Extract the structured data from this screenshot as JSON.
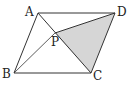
{
  "diagram": {
    "type": "parallelogram",
    "fill_color": "#d6d6d6",
    "stroke_color": "#333333",
    "vertices": {
      "A": {
        "label": "A",
        "x": 38,
        "y": 13
      },
      "D": {
        "label": "D",
        "x": 115,
        "y": 13
      },
      "B": {
        "label": "B",
        "x": 14,
        "y": 73
      },
      "C": {
        "label": "C",
        "x": 91,
        "y": 73
      },
      "P": {
        "label": "P",
        "x": 55,
        "y": 33
      }
    },
    "segments": [
      "AD",
      "AB",
      "BC",
      "CD",
      "AC",
      "BD",
      "PD"
    ],
    "shaded": "triangle PCD"
  }
}
